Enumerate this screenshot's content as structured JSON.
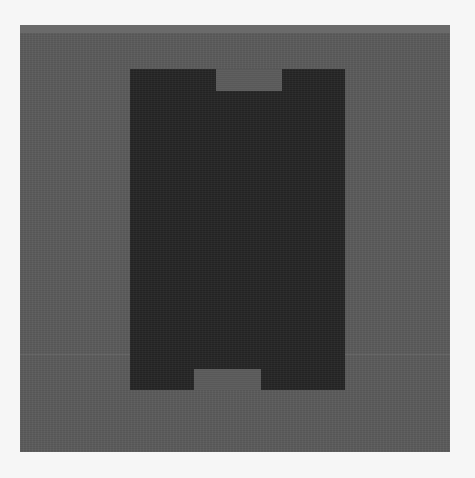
{
  "image": {
    "description": "Grayscale photo of a dark rectangular component with notches at top and bottom on a gray panel",
    "colors": {
      "page_background": "#f6f6f6",
      "panel": "#5b5b5b",
      "panel_top_strip": "#6a6a6a",
      "component": "#262626"
    },
    "panel": {
      "x": 20,
      "y": 25,
      "width": 430,
      "height": 427
    },
    "component": {
      "x": 130,
      "y": 69,
      "width": 215,
      "height": 321,
      "top_notch": {
        "x": 216,
        "y": 69,
        "width": 66,
        "height": 22
      },
      "bottom_notch": {
        "x": 194,
        "y": 369,
        "width": 67,
        "height": 21
      }
    },
    "faint_lines_y": [
      354
    ]
  }
}
